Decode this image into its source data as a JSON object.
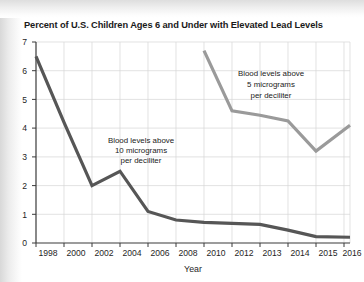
{
  "figure": {
    "title": "Percent of U.S. Children Ages 6 and Under with Elevated Lead Levels",
    "background_color": "#ffffff"
  },
  "chart_data": {
    "type": "line",
    "title": "Percent of U.S. Children Ages 6 and Under with Elevated Lead Levels",
    "xlabel": "Year",
    "ylabel": "",
    "categories": [
      "1998",
      "2000",
      "2002",
      "2004",
      "2006",
      "2008",
      "2010",
      "2012",
      "2013",
      "2014",
      "2015",
      "2016"
    ],
    "x_tick_labels": [
      "1998",
      "2000",
      "2002",
      "2004",
      "2006",
      "2008",
      "2010",
      "2012",
      "2013",
      "2014",
      "2015",
      "2016"
    ],
    "y_tick_labels": [
      "0",
      "1",
      "2",
      "3",
      "4",
      "5",
      "6",
      "7"
    ],
    "ylim": [
      0,
      7
    ],
    "grid": true,
    "legend_position": "inline-annotations",
    "series": [
      {
        "name": "Blood levels above 10 micrograms per deciliter",
        "color": "#565656",
        "x": [
          "1998",
          "2000",
          "2002",
          "2004",
          "2006",
          "2008",
          "2010",
          "2012",
          "2013",
          "2014",
          "2015",
          "2016"
        ],
        "values": [
          6.5,
          4.2,
          2.0,
          2.5,
          1.1,
          0.8,
          0.72,
          0.68,
          0.65,
          0.45,
          0.22,
          0.2
        ]
      },
      {
        "name": "Blood levels above 5 micrograms per deciliter",
        "color": "#9a9a9a",
        "x": [
          "2010",
          "2012",
          "2013",
          "2014",
          "2015",
          "2016"
        ],
        "values": [
          6.7,
          4.6,
          4.45,
          4.25,
          3.2,
          4.1
        ]
      }
    ],
    "annotations": [
      {
        "id": "annotation-10-micrograms",
        "lines": [
          "Blood levels above",
          "10 micrograms",
          "per deciliter"
        ],
        "series_ref": "Blood levels above 10 micrograms per deciliter"
      },
      {
        "id": "annotation-5-micrograms",
        "lines": [
          "Blood levels above",
          "5 micrograms",
          "per deciliter"
        ],
        "series_ref": "Blood levels above 5 micrograms per deciliter"
      }
    ]
  }
}
